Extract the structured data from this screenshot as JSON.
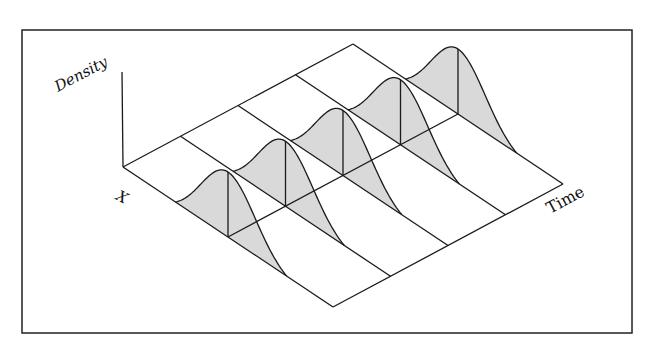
{
  "diagram": {
    "type": "3d-density-over-time",
    "labels": {
      "density": "Density",
      "x": "X",
      "time": "Time"
    },
    "time_slices": 5,
    "colors": {
      "line": "#1a1a1a",
      "fill": "#d9d9d9",
      "frame": "#222222",
      "background": "#ffffff"
    },
    "geometry": {
      "frame": {
        "x": 22,
        "y": 30,
        "w": 610,
        "h": 303
      },
      "origin": [
        123,
        167
      ],
      "time_step": [
        57.5,
        -30.75
      ],
      "x_vec": [
        210,
        140
      ],
      "density_axis_top": [
        122,
        72
      ],
      "bell_height": 65,
      "bell_center": 0.5,
      "bell_sigma": 0.13,
      "bell_start": 0.25,
      "bell_end": 0.78
    }
  }
}
